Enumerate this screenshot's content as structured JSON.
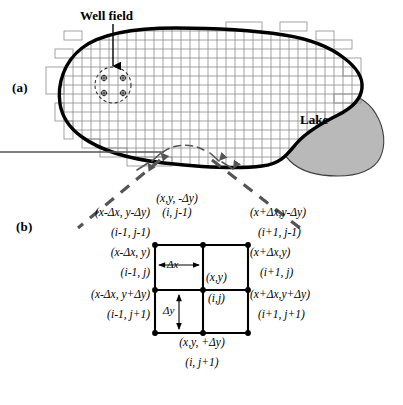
{
  "figure": {
    "panel_a": {
      "label": "(a)",
      "annotations": {
        "well_field": "Well field",
        "lake": "Lake"
      },
      "colors": {
        "lake_fill": "#b9b9b9",
        "lake_outline": "#3d3d3d",
        "aquifer_boundary": "#000000",
        "grid_line": "#8c8c8c"
      },
      "grid": {
        "columns": 26,
        "rows": 15,
        "cell_size_px": 9
      },
      "well_count": 4
    },
    "panel_b": {
      "label": "(b)",
      "colors": {
        "cell_line": "#000000",
        "node_dot": "#000000",
        "callout_dash": "#555555"
      },
      "spacing": {
        "dx": "Δx",
        "dy": "Δy"
      },
      "center_node": {
        "coord": "(x,y)",
        "index": "(i,j)"
      },
      "nodes": [
        {
          "position": "top-left",
          "coord": "(x-Δx, y-Δy)",
          "index": "(i-1, j-1)"
        },
        {
          "position": "top-center",
          "coord": "(x,y, -Δy)",
          "index": "(i, j-1)"
        },
        {
          "position": "top-right",
          "coord": "(x+Δx,y-Δy)",
          "index": "(i+1, j-1)"
        },
        {
          "position": "middle-left",
          "coord": "(x-Δx, y)",
          "index": "(i-1, j)"
        },
        {
          "position": "middle-right",
          "coord": "(x+Δx,y)",
          "index": "(i+1, j)"
        },
        {
          "position": "bottom-left",
          "coord": "(x-Δx, y+Δy)",
          "index": "(i-1, j+1)"
        },
        {
          "position": "bottom-center",
          "coord": "(x,y, +Δy)",
          "index": "(i, j+1)"
        },
        {
          "position": "bottom-right",
          "coord": "(x+Δx,y+Δy)",
          "index": "(i+1, j+1)"
        }
      ]
    }
  }
}
